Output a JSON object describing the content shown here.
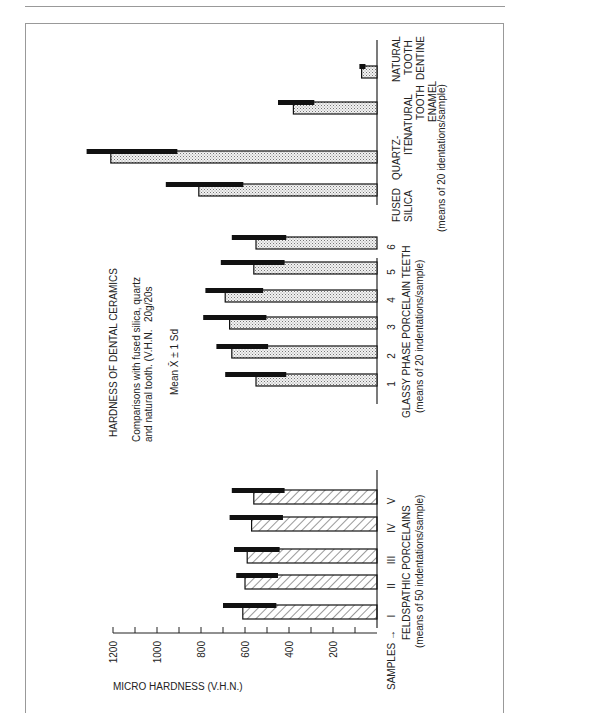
{
  "figure": {
    "title": "HARDNESS OF DENTAL CERAMICS",
    "subtitle_line1": "Comparisons with fused silica, quartz",
    "subtitle_line2": "and natural tooth. (V.H.N.",
    "subtitle_load": "20g/20s",
    "legend_note": "Mean X̄ ± 1 Sd",
    "samples_label": "SAMPLES →"
  },
  "chart_data": {
    "type": "bar",
    "orientation": "rotated horizontal bars (page rotated 90°)",
    "title": "HARDNESS OF DENTAL CERAMICS",
    "ylabel": "MICRO HARDNESS (V.H.N.)",
    "ylim": [
      0,
      1200
    ],
    "ticks": [
      200,
      400,
      600,
      800,
      1000,
      1200
    ],
    "groups": [
      {
        "name": "FELDSPATHIC PORCELAINS",
        "note": "(means of 50 indentations/sample)",
        "pattern": "hatched",
        "categories": [
          "I",
          "II",
          "III",
          "IV",
          "V"
        ],
        "values": [
          610,
          600,
          590,
          570,
          560
        ],
        "mean_plus_sd": [
          700,
          640,
          650,
          670,
          660
        ]
      },
      {
        "name": "GLASSY PHASE PORCELAIN TEETH",
        "note": "(means of 20 indentations/sample)",
        "pattern": "stippled",
        "categories": [
          "1",
          "2",
          "3",
          "4",
          "5",
          "6"
        ],
        "values": [
          550,
          660,
          670,
          690,
          560,
          550
        ],
        "mean_plus_sd": [
          690,
          730,
          790,
          780,
          710,
          660
        ]
      },
      {
        "name": "Reference materials",
        "note": "(means of 20 identations/sample)",
        "pattern": "stippled",
        "categories": [
          "FUSED SILICA",
          "QUARTZ-ITE",
          "NATURAL TOOTH ENAMEL",
          "NATURAL TOOTH DENTINE"
        ],
        "values": [
          810,
          1210,
          380,
          70
        ],
        "mean_plus_sd": [
          960,
          1320,
          450,
          80
        ]
      }
    ]
  }
}
